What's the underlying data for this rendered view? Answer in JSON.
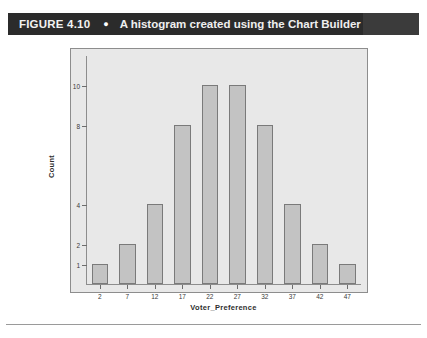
{
  "caption": {
    "figure_number": "FIGURE 4.10",
    "bullet": "●",
    "text": "A histogram created using the Chart Builder"
  },
  "colors": {
    "caption_bar": "#2b2b2b",
    "caption_text": "#efefef",
    "plot_background": "#e8e8e8",
    "bar_fill": "#c3c3c3",
    "bar_stroke": "#7a7a7a",
    "frame_stroke": "#8d8d8d"
  },
  "chart_data": {
    "type": "bar",
    "title": "",
    "subtitle": "",
    "xlabel": "Voter_Preference",
    "ylabel": "Count",
    "categories": [
      "2",
      "7",
      "12",
      "17",
      "22",
      "27",
      "32",
      "37",
      "42",
      "47"
    ],
    "values": [
      1,
      2,
      4,
      8,
      10,
      10,
      8,
      4,
      2,
      1
    ],
    "ytick_labels": [
      "1",
      "2",
      "4",
      "8",
      "10"
    ],
    "ytick_values": [
      1,
      2,
      4,
      8,
      10
    ],
    "ylim": [
      0,
      11.5
    ],
    "xlim_categories": 10,
    "grid": false,
    "legend": null,
    "legend_position": "none",
    "series": [
      {
        "name": "Count",
        "values": [
          1,
          2,
          4,
          8,
          10,
          10,
          8,
          4,
          2,
          1
        ]
      }
    ]
  }
}
